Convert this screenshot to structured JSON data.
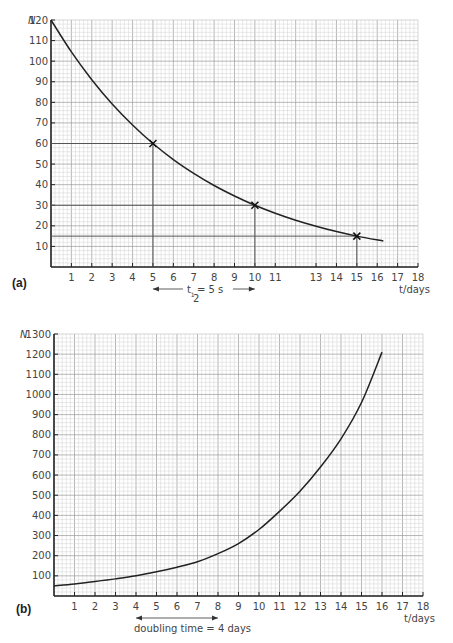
{
  "chart_data": [
    {
      "panel_label": "(a)",
      "type": "line",
      "title": "",
      "xlabel": "t/days",
      "ylabel": "N",
      "xlim": [
        0,
        18
      ],
      "ylim": [
        0,
        120
      ],
      "grid": true,
      "x_ticks": [
        "1",
        "2",
        "3",
        "4",
        "5",
        "6",
        "7",
        "8",
        "9",
        "10",
        "11",
        "13",
        "14",
        "15",
        "16",
        "17",
        "18"
      ],
      "y_ticks": [
        "10",
        "20",
        "30",
        "40",
        "50",
        "60",
        "70",
        "80",
        "90",
        "100",
        "110",
        "120"
      ],
      "series": [
        {
          "name": "decay curve",
          "x": [
            0,
            1,
            2,
            3,
            4,
            5,
            6,
            7,
            8,
            9,
            10,
            11,
            12,
            13,
            14,
            15,
            16.3
          ],
          "values": [
            120,
            104.5,
            91,
            79.2,
            69,
            60,
            52.2,
            45.5,
            39.6,
            34.5,
            30,
            26.1,
            22.7,
            19.8,
            17.2,
            15,
            12.6
          ]
        }
      ],
      "markers": [
        {
          "x": 5,
          "y": 60
        },
        {
          "x": 10,
          "y": 30
        },
        {
          "x": 15,
          "y": 15
        }
      ],
      "guides": [
        {
          "x": 5,
          "y": 60
        },
        {
          "x": 10,
          "y": 30
        },
        {
          "x": 15,
          "y": 15
        }
      ],
      "annotation": {
        "text": "t½ = 5 s",
        "t": "t",
        "sub": "1",
        "subden": "2",
        "rest": " = 5 s",
        "from": 5,
        "to": 10
      }
    },
    {
      "panel_label": "(b)",
      "type": "line",
      "title": "",
      "xlabel": "t/days",
      "ylabel": "N",
      "xlim": [
        0,
        18
      ],
      "ylim": [
        0,
        1300
      ],
      "grid": true,
      "x_ticks": [
        "1",
        "2",
        "3",
        "4",
        "5",
        "6",
        "7",
        "8",
        "9",
        "10",
        "11",
        "12",
        "13",
        "14",
        "15",
        "16",
        "17",
        "18"
      ],
      "y_ticks": [
        "100",
        "200",
        "300",
        "400",
        "500",
        "600",
        "700",
        "800",
        "900",
        "1000",
        "1100",
        "1200",
        "1300"
      ],
      "series": [
        {
          "name": "growth curve",
          "x": [
            0,
            1,
            2,
            3,
            4,
            5,
            6,
            7,
            8,
            9,
            10,
            11,
            12,
            13,
            14,
            15,
            16
          ],
          "values": [
            50,
            60,
            72,
            85,
            100,
            120,
            143,
            170,
            210,
            260,
            330,
            420,
            520,
            640,
            780,
            960,
            1210
          ]
        }
      ],
      "annotation": {
        "text": "doubling time = 4 days",
        "from": 4,
        "to": 8
      }
    }
  ]
}
